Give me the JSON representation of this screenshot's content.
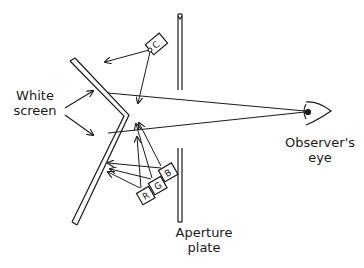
{
  "diagram": {
    "type": "optical apparatus schematic",
    "labels": {
      "white_screen_line1": "White",
      "white_screen_line2": "screen",
      "aperture_line1": "Aperture",
      "aperture_line2": "plate",
      "observer_line1": "Observer's",
      "observer_line2": "eye"
    },
    "projectors": [
      {
        "id": "C",
        "label": "C"
      },
      {
        "id": "B",
        "label": "B"
      },
      {
        "id": "G",
        "label": "G"
      },
      {
        "id": "R",
        "label": "R"
      }
    ],
    "colors": {
      "line": "#1a1a1a",
      "background": "#ffffff"
    }
  }
}
